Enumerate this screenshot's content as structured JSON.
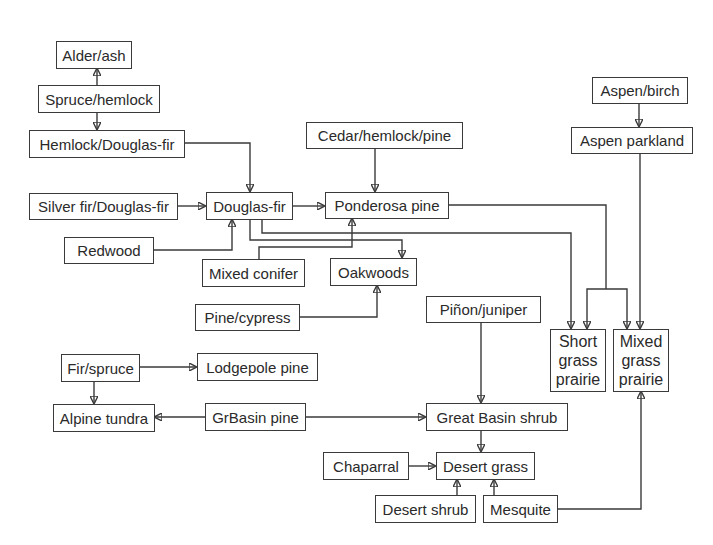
{
  "diagram": {
    "type": "vegetation-succession-flowchart",
    "nodes": {
      "alder_ash": "Alder/ash",
      "spruce_hemlock": "Spruce/hemlock",
      "hemlock_douglas_fir": "Hemlock/Douglas-fir",
      "cedar_hemlock_pine": "Cedar/hemlock/pine",
      "aspen_birch": "Aspen/birch",
      "aspen_parkland": "Aspen parkland",
      "silver_fir_douglas_fir": "Silver fir/Douglas-fir",
      "douglas_fir": "Douglas-fir",
      "ponderosa_pine": "Ponderosa pine",
      "redwood": "Redwood",
      "mixed_conifer": "Mixed conifer",
      "oakwoods": "Oakwoods",
      "pine_cypress": "Pine/cypress",
      "pinon_juniper": "Piñon/juniper",
      "short_grass_prairie": [
        "Short",
        "grass",
        "prairie"
      ],
      "mixed_grass_prairie": [
        "Mixed",
        "grass",
        "prairie"
      ],
      "fir_spruce": "Fir/spruce",
      "lodgepole_pine": "Lodgepole pine",
      "alpine_tundra": "Alpine tundra",
      "grbasin_pine": "GrBasin pine",
      "great_basin_shrub": "Great Basin shrub",
      "chaparral": "Chaparral",
      "desert_grass": "Desert grass",
      "desert_shrub": "Desert shrub",
      "mesquite": "Mesquite"
    },
    "edges": [
      {
        "from": "Spruce/hemlock",
        "to": "Alder/ash"
      },
      {
        "from": "Spruce/hemlock",
        "to": "Hemlock/Douglas-fir"
      },
      {
        "from": "Hemlock/Douglas-fir",
        "to": "Douglas-fir"
      },
      {
        "from": "Silver fir/Douglas-fir",
        "to": "Douglas-fir"
      },
      {
        "from": "Redwood",
        "to": "Douglas-fir"
      },
      {
        "from": "Douglas-fir",
        "to": "Ponderosa pine"
      },
      {
        "from": "Douglas-fir",
        "to": "Oakwoods"
      },
      {
        "from": "Douglas-fir",
        "to": "Short grass prairie"
      },
      {
        "from": "Cedar/hemlock/pine",
        "to": "Ponderosa pine"
      },
      {
        "from": "Mixed conifer",
        "to": "Ponderosa pine"
      },
      {
        "from": "Pine/cypress",
        "to": "Oakwoods"
      },
      {
        "from": "Ponderosa pine",
        "to": "Short grass prairie"
      },
      {
        "from": "Ponderosa pine",
        "to": "Mixed grass prairie"
      },
      {
        "from": "Aspen/birch",
        "to": "Aspen parkland"
      },
      {
        "from": "Aspen parkland",
        "to": "Mixed grass prairie"
      },
      {
        "from": "Fir/spruce",
        "to": "Lodgepole pine"
      },
      {
        "from": "Fir/spruce",
        "to": "Alpine tundra"
      },
      {
        "from": "GrBasin pine",
        "to": "Alpine tundra"
      },
      {
        "from": "GrBasin pine",
        "to": "Great Basin shrub"
      },
      {
        "from": "Piñon/juniper",
        "to": "Great Basin shrub"
      },
      {
        "from": "Great Basin shrub",
        "to": "Desert grass"
      },
      {
        "from": "Chaparral",
        "to": "Desert grass"
      },
      {
        "from": "Desert shrub",
        "to": "Desert grass"
      },
      {
        "from": "Mesquite",
        "to": "Desert grass"
      },
      {
        "from": "Mesquite",
        "to": "Mixed grass prairie"
      }
    ],
    "colors": {
      "line": "#3a3a3a",
      "text": "#2a2a2a",
      "background": "#ffffff"
    }
  }
}
